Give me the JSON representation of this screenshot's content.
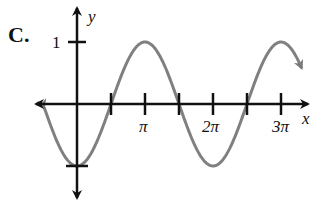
{
  "figure_label": "C.",
  "chart_data": {
    "type": "line",
    "title": "",
    "function": "y = -cos(x)",
    "xlabel": "x",
    "ylabel": "y",
    "x_ticks": [
      {
        "value": 1.5708,
        "label": ""
      },
      {
        "value": 3.1416,
        "label": "π"
      },
      {
        "value": 4.7124,
        "label": ""
      },
      {
        "value": 6.2832,
        "label": "2π"
      },
      {
        "value": 7.854,
        "label": ""
      },
      {
        "value": 9.4248,
        "label": "3π"
      }
    ],
    "y_ticks": [
      {
        "value": 1,
        "label": "1"
      },
      {
        "value": -1,
        "label": ""
      }
    ],
    "xlim": [
      -1.55,
      10.8
    ],
    "ylim": [
      -1.55,
      1.6
    ],
    "series": [
      {
        "name": "-cos(x)",
        "color": "#808080",
        "x": [
          -1.5,
          0,
          1.5708,
          3.1416,
          4.7124,
          6.2832,
          7.854,
          9.4248,
          10.4
        ],
        "values": [
          -0.07,
          -1,
          0,
          1,
          0,
          -1,
          0,
          1,
          0.5
        ]
      }
    ],
    "grid": false,
    "legend": null,
    "arrows": "both ends of curve and axes"
  },
  "labels": {
    "x_axis": "x",
    "y_axis": "y",
    "tick_pi": "π",
    "tick_2pi": "2π",
    "tick_3pi": "3π",
    "tick_one": "1"
  }
}
